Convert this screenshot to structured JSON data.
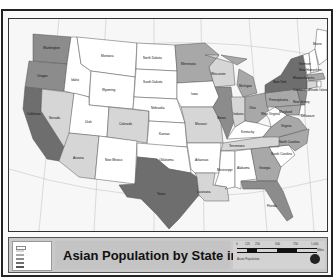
{
  "map": {
    "title": "Asian Population by State in 2007",
    "colors": {
      "darkest": "#6e6e6e",
      "dark": "#8c8c8c",
      "medium": "#a8a8a8",
      "light": "#d6d6d6",
      "none": "#ffffff",
      "ocean": "#f7f7f7",
      "canada_mexico": "#f2f2f2"
    },
    "states": [
      {
        "name": "Washington",
        "shade": "dark"
      },
      {
        "name": "Oregon",
        "shade": "dark"
      },
      {
        "name": "California",
        "shade": "darkest"
      },
      {
        "name": "Nevada",
        "shade": "light"
      },
      {
        "name": "Idaho",
        "shade": "none"
      },
      {
        "name": "Montana",
        "shade": "none"
      },
      {
        "name": "Wyoming",
        "shade": "none"
      },
      {
        "name": "Utah",
        "shade": "none"
      },
      {
        "name": "Colorado",
        "shade": "light"
      },
      {
        "name": "Arizona",
        "shade": "light"
      },
      {
        "name": "New Mexico",
        "shade": "none"
      },
      {
        "name": "North Dakota",
        "shade": "none"
      },
      {
        "name": "South Dakota",
        "shade": "none"
      },
      {
        "name": "Nebraska",
        "shade": "none"
      },
      {
        "name": "Kansas",
        "shade": "none"
      },
      {
        "name": "Oklahoma",
        "shade": "none"
      },
      {
        "name": "Texas",
        "shade": "darkest"
      },
      {
        "name": "Minnesota",
        "shade": "medium"
      },
      {
        "name": "Iowa",
        "shade": "none"
      },
      {
        "name": "Missouri",
        "shade": "light"
      },
      {
        "name": "Arkansas",
        "shade": "none"
      },
      {
        "name": "Louisiana",
        "shade": "light"
      },
      {
        "name": "Wisconsin",
        "shade": "light"
      },
      {
        "name": "Illinois",
        "shade": "dark"
      },
      {
        "name": "Michigan",
        "shade": "medium"
      },
      {
        "name": "Indiana",
        "shade": "light"
      },
      {
        "name": "Ohio",
        "shade": "medium"
      },
      {
        "name": "Kentucky",
        "shade": "none"
      },
      {
        "name": "Tennessee",
        "shade": "light"
      },
      {
        "name": "Mississippi",
        "shade": "none"
      },
      {
        "name": "Alabama",
        "shade": "none"
      },
      {
        "name": "Georgia",
        "shade": "medium"
      },
      {
        "name": "Florida",
        "shade": "dark"
      },
      {
        "name": "South Carolina",
        "shade": "none"
      },
      {
        "name": "North Carolina",
        "shade": "medium"
      },
      {
        "name": "Virginia",
        "shade": "medium"
      },
      {
        "name": "West Virginia",
        "shade": "none"
      },
      {
        "name": "Pennsylvania",
        "shade": "medium"
      },
      {
        "name": "New York",
        "shade": "darkest"
      },
      {
        "name": "New Jersey",
        "shade": "dark"
      },
      {
        "name": "Maryland",
        "shade": "medium"
      },
      {
        "name": "Delaware",
        "shade": "none"
      },
      {
        "name": "Vermont",
        "shade": "none"
      },
      {
        "name": "New Hampshire",
        "shade": "none"
      },
      {
        "name": "Massachusetts",
        "shade": "medium"
      },
      {
        "name": "Connecticut",
        "shade": "light"
      },
      {
        "name": "Rhode Island",
        "shade": "none"
      },
      {
        "name": "Maine",
        "shade": "none"
      }
    ],
    "legend_title": "Asian Population",
    "scale": {
      "labels": [
        "0",
        "125",
        "250",
        "500",
        "750",
        "1,000"
      ],
      "unit": "Miles"
    }
  }
}
